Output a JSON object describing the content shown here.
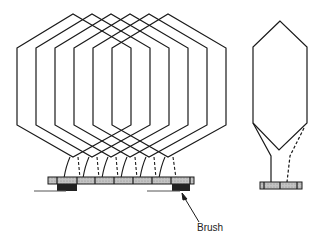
{
  "diagram": {
    "labels": {
      "brush": "Brush"
    },
    "left_view": {
      "description": "Armature winding coils connected to commutator segments",
      "coil_count": 6,
      "commutator_segments": 7,
      "brushes": 2
    },
    "right_view": {
      "description": "Single coil end view with commutator",
      "coil_count": 1
    },
    "colors": {
      "line": "#1a1a1a",
      "segment_fill": "#b8b8b8",
      "brush_fill": "#222222"
    }
  }
}
